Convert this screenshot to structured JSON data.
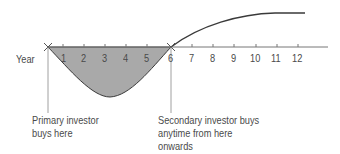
{
  "axis": {
    "label": "Year",
    "ticks": [
      "1",
      "2",
      "3",
      "4",
      "5",
      "6",
      "7",
      "8",
      "9",
      "10",
      "11",
      "12"
    ]
  },
  "annotations": {
    "primary": [
      "Primary investor",
      "buys here"
    ],
    "secondary": [
      "Secondary investor buys",
      "anytime from here",
      "onwards"
    ]
  },
  "colors": {
    "fill": "#a9a9a9",
    "line": "#3a3a3a",
    "text": "#4a4a4a"
  }
}
